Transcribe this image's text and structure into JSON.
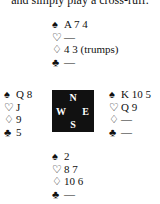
{
  "caption": "and simply play a cross-ruff.",
  "suits": {
    "spades": "♠",
    "hearts": "♡",
    "diamonds": "♢",
    "clubs": "♣"
  },
  "compass": {
    "north": "N",
    "south": "S",
    "west": "W",
    "east": "E"
  },
  "hands": {
    "north": {
      "spades": "A 7 4",
      "hearts": "—",
      "diamonds": "4 3 (trumps)",
      "clubs": "—"
    },
    "west": {
      "spades": "Q 8",
      "hearts": "J",
      "diamonds": "9",
      "clubs": "5"
    },
    "east": {
      "spades": "K 10 5",
      "hearts": "Q 9",
      "diamonds": "—",
      "clubs": "—"
    },
    "south": {
      "spades": "2",
      "hearts": "8 7",
      "diamonds": "10 6",
      "clubs": "—"
    }
  }
}
